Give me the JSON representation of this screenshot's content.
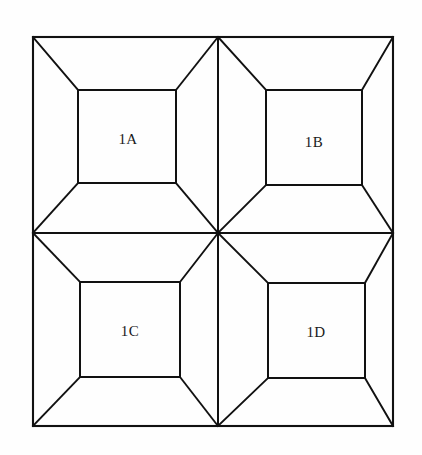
{
  "diagram": {
    "type": "line-diagram",
    "background_color": "#fefefe",
    "line_color": "#111111",
    "label_color": "#1a1a1a",
    "frame": {
      "x1": 33,
      "y1": 37,
      "x2": 393,
      "y2": 426
    },
    "center": {
      "x": 218,
      "y": 233
    },
    "cells": [
      {
        "id": "1A",
        "label": "1A",
        "position": "top-left",
        "outer": {
          "x1": 33,
          "y1": 37,
          "x2": 218,
          "y2": 233
        },
        "inner": {
          "x1": 78,
          "y1": 90,
          "x2": 176,
          "y2": 183
        },
        "label_x": 128,
        "label_y": 139
      },
      {
        "id": "1B",
        "label": "1B",
        "position": "top-right",
        "outer": {
          "x1": 218,
          "y1": 37,
          "x2": 393,
          "y2": 233
        },
        "inner": {
          "x1": 266,
          "y1": 90,
          "x2": 362,
          "y2": 185
        },
        "label_x": 314,
        "label_y": 142
      },
      {
        "id": "1C",
        "label": "1C",
        "position": "bottom-left",
        "outer": {
          "x1": 33,
          "y1": 233,
          "x2": 218,
          "y2": 426
        },
        "inner": {
          "x1": 80,
          "y1": 282,
          "x2": 180,
          "y2": 377
        },
        "label_x": 130,
        "label_y": 331
      },
      {
        "id": "1D",
        "label": "1D",
        "position": "bottom-right",
        "outer": {
          "x1": 218,
          "y1": 233,
          "x2": 393,
          "y2": 426
        },
        "inner": {
          "x1": 268,
          "y1": 283,
          "x2": 365,
          "y2": 378
        },
        "label_x": 316,
        "label_y": 332
      }
    ],
    "dividers": {
      "vertical_x": 218,
      "horizontal_y": 233
    }
  }
}
